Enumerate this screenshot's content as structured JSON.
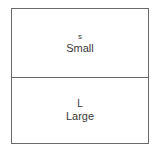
{
  "diagram": {
    "cells": [
      {
        "code": "s",
        "label": "Small"
      },
      {
        "code": "L",
        "label": "Large"
      }
    ],
    "colors": {
      "border": "#6a6a6a",
      "text": "#3a3a3a",
      "background": "#ffffff"
    }
  }
}
